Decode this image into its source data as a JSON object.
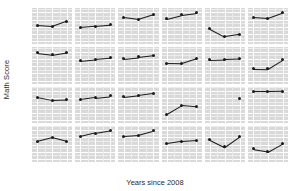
{
  "chart_data": {
    "type": "line",
    "title": "",
    "xlabel": "Years since 2008",
    "ylabel": "Math Score",
    "x": [
      0,
      1,
      2
    ],
    "xtick_labels": [
      "0",
      "1",
      "2"
    ],
    "xlim": [
      -0.35,
      2.35
    ],
    "grid": true,
    "legend": "none",
    "layout": {
      "rows": 4,
      "cols": 6,
      "facet_strips": "none"
    },
    "colors": {
      "panel_background": "#d9d9d9",
      "major_gridline": "#ffffff",
      "minor_gridline": "#ececec",
      "line": "#1a1a1a",
      "point": "#1a1a1a",
      "text": "#4a4a4a",
      "title_text": "#2b2b2b"
    },
    "row_axes": [
      {
        "row": 1,
        "ylim": [
          638,
          663
        ],
        "yticks": [
          640,
          645,
          650,
          655,
          660
        ],
        "ytick_labels": [
          "640",
          "645",
          "650",
          "655",
          "660"
        ]
      },
      {
        "row": 2,
        "ylim": [
          638,
          663
        ],
        "yticks": [
          640,
          645,
          650,
          655,
          660
        ],
        "ytick_labels": [
          "640",
          "645",
          "650",
          "655",
          "660"
        ]
      },
      {
        "row": 3,
        "ylim": [
          638,
          663
        ],
        "yticks": [
          640,
          645,
          650,
          655,
          660
        ],
        "ytick_labels": [
          "640",
          "645",
          "650",
          "655",
          "660"
        ]
      },
      {
        "row": 4,
        "ylim": [
          638,
          663
        ],
        "yticks": [
          640,
          645,
          650,
          655,
          660
        ],
        "ytick_labels": [
          "640",
          "645",
          "650",
          "655",
          "660"
        ]
      }
    ],
    "panels": [
      {
        "row": 1,
        "col": 1,
        "values": [
          651.0,
          650.3,
          654.0
        ]
      },
      {
        "row": 1,
        "col": 2,
        "values": [
          649.6,
          650.4,
          651.3
        ]
      },
      {
        "row": 1,
        "col": 3,
        "values": [
          656.5,
          655.2,
          658.4
        ]
      },
      {
        "row": 1,
        "col": 4,
        "values": [
          655.6,
          658.3,
          659.6
        ]
      },
      {
        "row": 1,
        "col": 5,
        "values": [
          648.8,
          643.4,
          645.0
        ]
      },
      {
        "row": 1,
        "col": 6,
        "values": [
          656.7,
          656.0,
          659.8
        ]
      },
      {
        "row": 2,
        "col": 1,
        "values": [
          659.1,
          657.9,
          659.6
        ]
      },
      {
        "row": 2,
        "col": 2,
        "values": [
          653.7,
          654.8,
          655.6
        ]
      },
      {
        "row": 2,
        "col": 3,
        "values": [
          655.2,
          656.3,
          657.5
        ]
      },
      {
        "row": 2,
        "col": 4,
        "values": [
          652.0,
          651.9,
          655.3
        ]
      },
      {
        "row": 2,
        "col": 5,
        "values": [
          654.4,
          654.7,
          655.1
        ]
      },
      {
        "row": 2,
        "col": 6,
        "values": [
          648.3,
          648.1,
          654.4
        ]
      },
      {
        "row": 3,
        "col": 1,
        "values": [
          655.6,
          653.6,
          654.0
        ]
      },
      {
        "row": 3,
        "col": 2,
        "values": [
          654.1,
          655.4,
          656.5
        ]
      },
      {
        "row": 3,
        "col": 3,
        "values": [
          655.8,
          657.0,
          658.3
        ]
      },
      {
        "row": 3,
        "col": 4,
        "values": [
          644.0,
          650.0,
          649.2
        ]
      },
      {
        "row": 3,
        "col": 5,
        "values": [
          null,
          null,
          655.0
        ]
      },
      {
        "row": 3,
        "col": 6,
        "values": [
          659.6,
          659.6,
          659.7
        ]
      },
      {
        "row": 4,
        "col": 1,
        "values": [
          652.3,
          655.0,
          652.4
        ]
      },
      {
        "row": 4,
        "col": 2,
        "values": [
          655.6,
          658.0,
          659.8
        ]
      },
      {
        "row": 4,
        "col": 3,
        "values": [
          655.9,
          656.6,
          659.5
        ]
      },
      {
        "row": 4,
        "col": 4,
        "values": [
          650.8,
          652.4,
          653.0
        ]
      },
      {
        "row": 4,
        "col": 5,
        "values": [
          653.5,
          648.4,
          655.6
        ]
      },
      {
        "row": 4,
        "col": 6,
        "values": [
          647.0,
          645.2,
          651.0
        ]
      }
    ]
  }
}
